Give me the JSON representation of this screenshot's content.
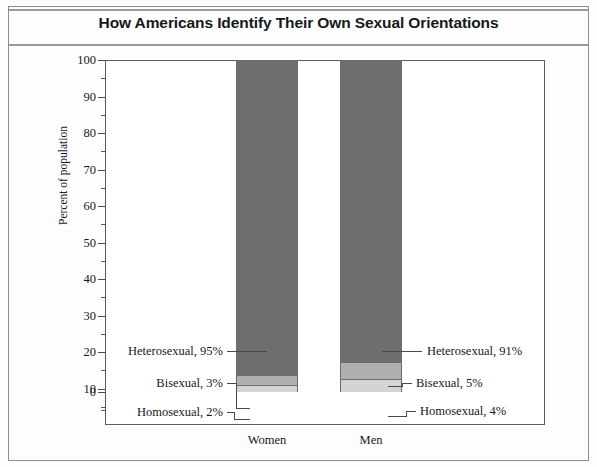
{
  "figure": {
    "title": "How Americans Identify Their Own Sexual Orientations"
  },
  "chart_data": {
    "type": "bar",
    "subtype": "stacked-bar",
    "title": "How Americans Identify Their Own Sexual Orientations",
    "xlabel": "",
    "ylabel": "Percent of population",
    "ylim": [
      0,
      100
    ],
    "ytick_labels": [
      "0",
      "10",
      "20",
      "30",
      "40",
      "50",
      "60",
      "70",
      "80",
      "90",
      "100"
    ],
    "ytick_values": [
      0,
      10,
      20,
      30,
      40,
      50,
      60,
      70,
      80,
      90,
      100
    ],
    "yminor_values": [
      5,
      15,
      25,
      35,
      45,
      55,
      65,
      75,
      85,
      95
    ],
    "grid": false,
    "legend": "none-inline-annotations",
    "categories": [
      "Women",
      "Men"
    ],
    "series": [
      {
        "name": "Homosexual",
        "values": [
          2,
          4
        ],
        "color": "#d4d4d4"
      },
      {
        "name": "Bisexual",
        "values": [
          3,
          5
        ],
        "color": "#b0b0b0"
      },
      {
        "name": "Heterosexual",
        "values": [
          95,
          91
        ],
        "color": "#6e6e6e"
      }
    ],
    "annotations": [
      {
        "text": "Heterosexual, 95%",
        "category": "Women",
        "series": "Heterosexual",
        "value": 95,
        "side": "left"
      },
      {
        "text": "Bisexual, 3%",
        "category": "Women",
        "series": "Bisexual",
        "value": 3,
        "side": "left"
      },
      {
        "text": "Homosexual, 2%",
        "category": "Women",
        "series": "Homosexual",
        "value": 2,
        "side": "left"
      },
      {
        "text": "Heterosexual, 91%",
        "category": "Men",
        "series": "Heterosexual",
        "value": 91,
        "side": "right"
      },
      {
        "text": "Bisexual, 5%",
        "category": "Men",
        "series": "Bisexual",
        "value": 5,
        "side": "right"
      },
      {
        "text": "Homosexual, 4%",
        "category": "Men",
        "series": "Homosexual",
        "value": 4,
        "side": "right"
      }
    ]
  },
  "axis": {
    "y": {
      "labels": {
        "t0": "0",
        "t10": "10",
        "t20": "20",
        "t30": "30",
        "t40": "40",
        "t50": "50",
        "t60": "60",
        "t70": "70",
        "t80": "80",
        "t90": "90",
        "t100": "100"
      },
      "title": "Percent of population"
    },
    "x": {
      "categories": {
        "women": "Women",
        "men": "Men"
      }
    }
  },
  "labels": {
    "women_hetero": "Heterosexual, 95%",
    "women_bi": "Bisexual, 3%",
    "women_homo": "Homosexual, 2%",
    "men_hetero": "Heterosexual, 91%",
    "men_bi": "Bisexual, 5%",
    "men_homo": "Homosexual, 4%"
  },
  "colors": {
    "heterosexual": "#6e6e6e",
    "bisexual": "#b0b0b0",
    "homosexual": "#d4d4d4",
    "frame": "#5b5b5b",
    "text": "#16191b",
    "rule": "#9a9a9a"
  }
}
